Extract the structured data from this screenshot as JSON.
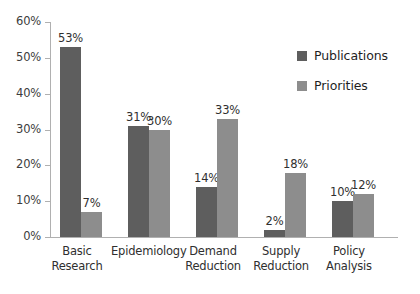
{
  "chart_data": {
    "type": "bar",
    "title": "",
    "xlabel": "",
    "ylabel": "",
    "ylim": [
      0,
      60
    ],
    "ytick_labels": [
      "0%",
      "10%",
      "20%",
      "30%",
      "40%",
      "50%",
      "60%"
    ],
    "ytick_values": [
      0,
      10,
      20,
      30,
      40,
      50,
      60
    ],
    "grid": false,
    "legend_position": "upper right",
    "categories": [
      "Basic Research",
      "Epidemiology",
      "Demand Reduction",
      "Supply Reduction",
      "Policy Analysis"
    ],
    "category_lines": [
      [
        "Basic",
        "Research"
      ],
      [
        "Epidemiology",
        ""
      ],
      [
        "Demand",
        "Reduction"
      ],
      [
        "Supply",
        "Reduction"
      ],
      [
        "Policy",
        "Analysis"
      ]
    ],
    "series": [
      {
        "name": "Publications",
        "color": "#5e5e5e",
        "values": [
          53,
          31,
          14,
          2,
          10
        ],
        "labels": [
          "53%",
          "31%",
          "14%",
          "2%",
          "10%"
        ]
      },
      {
        "name": "Priorities",
        "color": "#8d8d8d",
        "values": [
          7,
          30,
          33,
          18,
          12
        ],
        "labels": [
          "7%",
          "30%",
          "33%",
          "18%",
          "12%"
        ]
      }
    ]
  },
  "legend": {
    "items": [
      {
        "label": "Publications",
        "color": "#5e5e5e"
      },
      {
        "label": "Priorities",
        "color": "#8d8d8d"
      }
    ]
  },
  "colors": {
    "background": "#ffffff",
    "axis": "#b0b0b0",
    "text": "#2f2f2f",
    "publications": "#5e5e5e",
    "priorities": "#8d8d8d"
  }
}
